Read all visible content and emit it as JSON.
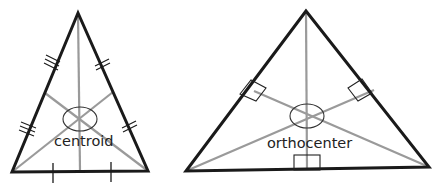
{
  "diagrams": [
    {
      "name": "centroid",
      "label": "centroid",
      "description": "Triangle with three medians meeting at the centroid; sides marked with tick marks indicating equal halves",
      "vertices": [
        [
          78,
          13
        ],
        [
          12,
          172
        ],
        [
          148,
          171
        ]
      ],
      "center": [
        80,
        119
      ]
    },
    {
      "name": "orthocenter",
      "label": "orthocenter",
      "description": "Triangle with three altitudes meeting at the orthocenter; right-angle marks where altitudes meet sides",
      "vertices": [
        [
          306,
          11
        ],
        [
          186,
          171
        ],
        [
          429,
          167
        ]
      ],
      "center": [
        307,
        116
      ]
    }
  ],
  "colors": {
    "side": "#1a1a1a",
    "segment": "#9a9a9a",
    "background": "#ffffff"
  }
}
